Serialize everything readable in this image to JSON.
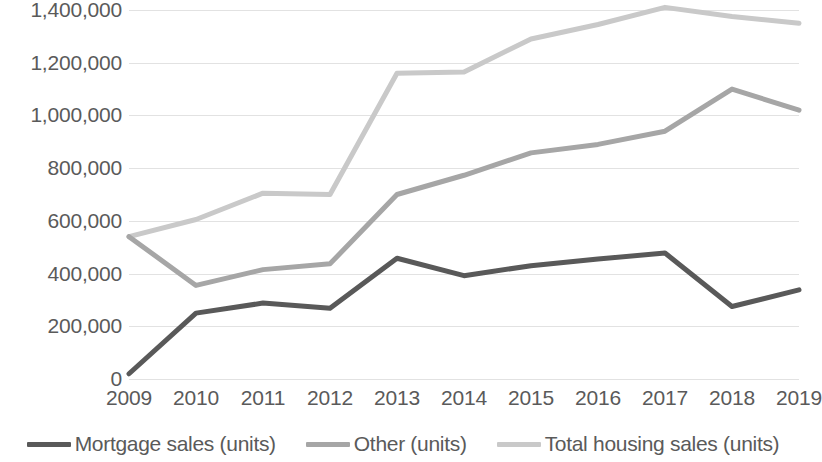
{
  "chart_data": {
    "type": "line",
    "title": "",
    "subtitle": "",
    "xlabel": "",
    "ylabel": "",
    "categories": [
      "2009",
      "2010",
      "2011",
      "2012",
      "2013",
      "2014",
      "2015",
      "2016",
      "2017",
      "2018",
      "2019"
    ],
    "ylim": [
      0,
      1400000
    ],
    "ytick_values": [
      0,
      200000,
      400000,
      600000,
      800000,
      1000000,
      1200000,
      1400000
    ],
    "ytick_labels": [
      "0",
      "200,000",
      "400,000",
      "600,000",
      "800,000",
      "1,000,000",
      "1,200,000",
      "1,400,000"
    ],
    "grid": true,
    "grid_axis": "y",
    "legend_position": "bottom",
    "series": [
      {
        "name": "Mortgage sales (units)",
        "color": "#595959",
        "values": [
          20000,
          250000,
          288000,
          268000,
          458000,
          392000,
          430000,
          455000,
          478000,
          275000,
          338000
        ]
      },
      {
        "name": "Other (units)",
        "color": "#a6a6a6",
        "values": [
          540000,
          355000,
          415000,
          437000,
          700000,
          773000,
          858000,
          890000,
          940000,
          1100000,
          1020000
        ]
      },
      {
        "name": "Total housing sales (units)",
        "color": "#c9c9c9",
        "values": [
          540000,
          605000,
          705000,
          700000,
          1160000,
          1165000,
          1290000,
          1345000,
          1410000,
          1375000,
          1350000
        ]
      }
    ]
  },
  "legend": {
    "items": [
      {
        "label": "Mortgage sales (units)",
        "color": "#595959"
      },
      {
        "label": "Other (units)",
        "color": "#a6a6a6"
      },
      {
        "label": "Total housing sales (units)",
        "color": "#c9c9c9"
      }
    ]
  },
  "colors": {
    "gridline": "#e2e2e2",
    "text": "#5a5a5a",
    "background": "#ffffff"
  }
}
